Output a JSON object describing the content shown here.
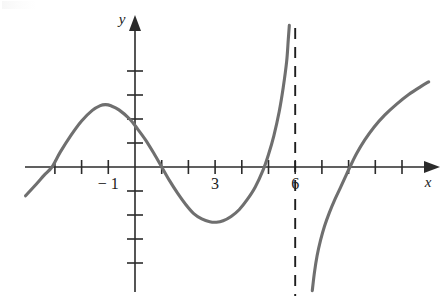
{
  "figure": {
    "background_color": "#ffffff",
    "curve_color": "#6f6f6f",
    "axis_color": "#2b2b2b",
    "asymptote_color": "#1e1e1e"
  },
  "axes": {
    "x_axis_label": "x",
    "y_axis_label": "y",
    "x_tick_labels": [
      "− 1",
      "3",
      "6"
    ],
    "x_labeled_values": [
      -1,
      3,
      6
    ],
    "x_tick_values": [
      -3,
      -2,
      -1,
      0,
      1,
      2,
      3,
      4,
      5,
      6,
      7,
      8,
      9,
      10
    ],
    "y_tick_values": [
      -4,
      -3,
      -2,
      -1,
      1,
      2,
      3,
      4
    ],
    "origin_px": {
      "x": 135,
      "y": 167
    },
    "unit_px": {
      "x": 26.7,
      "y": 24.0
    },
    "x_range": [
      -4.1,
      11.0
    ],
    "y_range": [
      -5.9,
      5.9
    ],
    "grid": false,
    "arrow_x_positive": true,
    "arrow_y_positive": true
  },
  "asymptote": {
    "name": "vertical-asymptote",
    "type": "vertical",
    "x_value": 6,
    "style": "dashed"
  },
  "chart_data": {
    "type": "line",
    "title": "",
    "subtitle": "",
    "xlabel": "x",
    "ylabel": "y",
    "xlim": [
      -4.1,
      11.0
    ],
    "ylim": [
      -5.9,
      5.9
    ],
    "grid": false,
    "legend": "none",
    "annotations": [
      {
        "text": "vertical asymptote at x = 6",
        "x": 6,
        "y": 0
      }
    ],
    "xticks": [
      -3,
      -2,
      -1,
      0,
      1,
      2,
      3,
      4,
      5,
      6,
      7,
      8,
      9,
      10
    ],
    "xticklabels": [
      "",
      "",
      "− 1",
      "",
      "",
      "",
      "3",
      "",
      "",
      "6",
      "",
      "",
      "",
      ""
    ],
    "yticks": [
      -4,
      -3,
      -2,
      -1,
      1,
      2,
      3,
      4
    ],
    "yticklabels": [
      "",
      "",
      "",
      "",
      "",
      "",
      "",
      ""
    ],
    "series": [
      {
        "name": "branch-left",
        "note": "rises from lower-left, crosses x-axis near x=-3.1, local maximum near (-1.1, 2.6), falls crossing x-axis near x=1.0, local minimum near (3.0, -2.3), rises steeply toward +infinity as x approaches 6 from the left",
        "points": [
          [
            -4.1,
            -1.2
          ],
          [
            -3.7,
            -0.72
          ],
          [
            -3.4,
            -0.34
          ],
          [
            -3.11,
            0.0
          ],
          [
            -2.8,
            0.62
          ],
          [
            -2.4,
            1.32
          ],
          [
            -2.0,
            1.92
          ],
          [
            -1.6,
            2.36
          ],
          [
            -1.3,
            2.56
          ],
          [
            -1.1,
            2.6
          ],
          [
            -0.9,
            2.55
          ],
          [
            -0.6,
            2.38
          ],
          [
            -0.2,
            2.0
          ],
          [
            0.1,
            1.58
          ],
          [
            0.4,
            1.12
          ],
          [
            0.7,
            0.58
          ],
          [
            1.0,
            0.0
          ],
          [
            1.3,
            -0.58
          ],
          [
            1.6,
            -1.1
          ],
          [
            1.9,
            -1.56
          ],
          [
            2.2,
            -1.94
          ],
          [
            2.5,
            -2.16
          ],
          [
            2.8,
            -2.28
          ],
          [
            3.05,
            -2.3
          ],
          [
            3.3,
            -2.24
          ],
          [
            3.6,
            -2.06
          ],
          [
            3.9,
            -1.78
          ],
          [
            4.2,
            -1.36
          ],
          [
            4.5,
            -0.84
          ],
          [
            4.8,
            -0.12
          ],
          [
            5.0,
            0.52
          ],
          [
            5.2,
            1.3
          ],
          [
            5.4,
            2.3
          ],
          [
            5.55,
            3.3
          ],
          [
            5.68,
            4.4
          ],
          [
            5.74,
            5.3
          ],
          [
            5.78,
            5.9
          ]
        ]
      },
      {
        "name": "branch-right",
        "note": "comes up from -infinity just right of x=6, crosses x-axis near x=8.05, continues rising to upper right",
        "points": [
          [
            6.64,
            -5.15
          ],
          [
            6.72,
            -4.4
          ],
          [
            6.82,
            -3.7
          ],
          [
            6.95,
            -3.05
          ],
          [
            7.1,
            -2.46
          ],
          [
            7.28,
            -1.9
          ],
          [
            7.5,
            -1.32
          ],
          [
            7.72,
            -0.8
          ],
          [
            7.9,
            -0.36
          ],
          [
            8.05,
            0.0
          ],
          [
            8.3,
            0.56
          ],
          [
            8.6,
            1.12
          ],
          [
            8.95,
            1.66
          ],
          [
            9.35,
            2.16
          ],
          [
            9.8,
            2.62
          ],
          [
            10.25,
            3.02
          ],
          [
            10.7,
            3.35
          ],
          [
            11.0,
            3.55
          ]
        ]
      }
    ]
  }
}
